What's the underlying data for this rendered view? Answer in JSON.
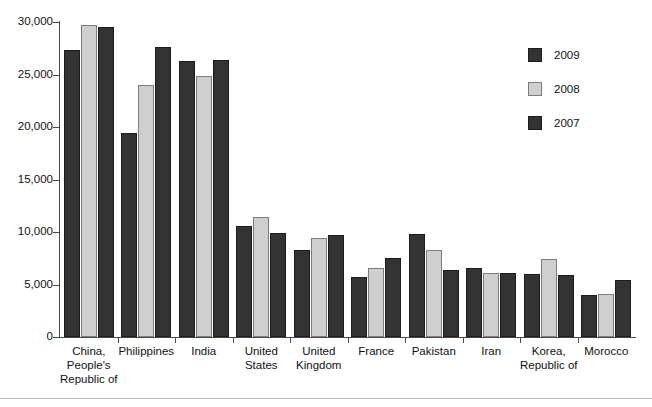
{
  "chart_data": {
    "type": "bar",
    "title": "",
    "xlabel": "",
    "ylabel": "",
    "ylim": [
      0,
      30000
    ],
    "yticks": [
      "0",
      "5,000",
      "10,000",
      "15,000",
      "20,000",
      "25,000",
      "30,000"
    ],
    "ytick_values": [
      0,
      5000,
      10000,
      15000,
      20000,
      25000,
      30000
    ],
    "grid": false,
    "legend_position": "right",
    "categories": [
      "China, People's Republic of",
      "Philippines",
      "India",
      "United States",
      "United Kingdom",
      "France",
      "Pakistan",
      "Iran",
      "Korea, Republic of",
      "Morocco"
    ],
    "category_lines": [
      [
        "China,",
        "People's",
        "Republic of"
      ],
      [
        "Philippines"
      ],
      [
        "India"
      ],
      [
        "United",
        "States"
      ],
      [
        "United",
        "Kingdom"
      ],
      [
        "France"
      ],
      [
        "Pakistan"
      ],
      [
        "Iran"
      ],
      [
        "Korea,",
        "Republic of"
      ],
      [
        "Morocco"
      ]
    ],
    "series": [
      {
        "name": "2009",
        "color": "#333333",
        "values": [
          27300,
          19400,
          26300,
          10600,
          8300,
          5700,
          9800,
          6600,
          6000,
          4000
        ]
      },
      {
        "name": "2008",
        "color": "#cfcfcf",
        "values": [
          29700,
          24000,
          24900,
          11400,
          9400,
          6600,
          8300,
          6100,
          7400,
          4100
        ]
      },
      {
        "name": "2007",
        "color": "#333333",
        "values": [
          29500,
          27600,
          26400,
          9900,
          9700,
          7500,
          6400,
          6100,
          5900,
          5400
        ]
      }
    ]
  },
  "legend": {
    "items": [
      {
        "label": "2009",
        "series": "s2009"
      },
      {
        "label": "2008",
        "series": "s2008"
      },
      {
        "label": "2007",
        "series": "s2007"
      }
    ]
  }
}
